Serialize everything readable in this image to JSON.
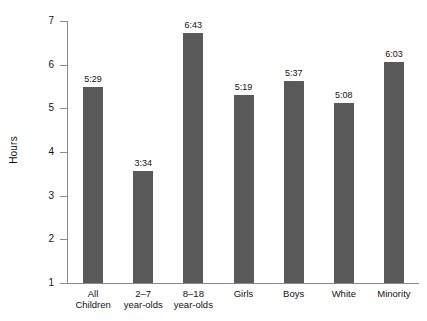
{
  "chart_data": {
    "type": "bar",
    "title": "",
    "xlabel": "",
    "ylabel": "Hours",
    "ylim": [
      1,
      7
    ],
    "yticks": [
      1,
      2,
      3,
      4,
      5,
      6,
      7
    ],
    "ytick_labels": [
      "1",
      "2",
      "3",
      "4",
      "5",
      "6",
      "7"
    ],
    "grid": false,
    "legend": null,
    "bar_color": "#595959",
    "axis_color": "#8a8a8a",
    "categories": [
      "All\nChildren",
      "2–7\nyear-olds",
      "8–18\nyear-olds",
      "Girls",
      "Boys",
      "White",
      "Minority"
    ],
    "data_labels": [
      "5:29",
      "3:34",
      "6:43",
      "5:19",
      "5:37",
      "5:08",
      "6:03"
    ],
    "values": [
      5.483,
      3.567,
      6.717,
      5.317,
      5.617,
      5.133,
      6.05
    ]
  }
}
